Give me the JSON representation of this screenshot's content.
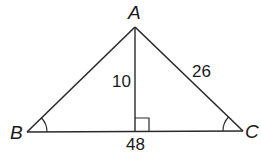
{
  "diagram": {
    "type": "triangle-with-altitude",
    "stroke_color": "#2a2a2a",
    "vertices": [
      {
        "name": "A",
        "x": 135,
        "y": 27,
        "label_x": 134,
        "label_y": 18
      },
      {
        "name": "B",
        "x": 27,
        "y": 132,
        "label_x": 10,
        "label_y": 140
      },
      {
        "name": "C",
        "x": 243,
        "y": 131,
        "label_x": 245,
        "label_y": 139
      }
    ],
    "altitude": {
      "from": "A",
      "foot_x": 135,
      "foot_y": 132,
      "right_angle_marker": true
    },
    "labels": {
      "A": "A",
      "B": "B",
      "C": "C",
      "altitude_length": "10",
      "side_AC": "26",
      "side_BC": "48"
    },
    "angle_marks": [
      "B",
      "C"
    ]
  }
}
